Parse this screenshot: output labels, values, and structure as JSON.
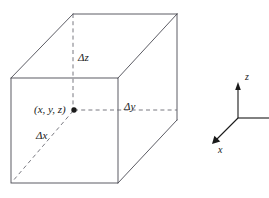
{
  "figure": {
    "top_caption_fragment": "",
    "stroke_color": "#4a4a52",
    "dash_color": "#6a6a72",
    "text_color": "#1a1a1a",
    "background": "#ffffff"
  },
  "box": {
    "name": "differential-volume-element",
    "front_face": {
      "top_left": [
        11,
        78
      ],
      "top_right": [
        118,
        78
      ],
      "bottom_right": [
        118,
        183
      ],
      "bottom_left": [
        11,
        183
      ]
    },
    "back_face": {
      "top_left": [
        73,
        14
      ],
      "top_right": [
        177,
        14
      ],
      "bottom_right": [
        177,
        120
      ],
      "bottom_left": [
        73,
        120
      ]
    }
  },
  "labels": {
    "delta_z": "Δz",
    "delta_y": "Δy",
    "delta_x": "Δx",
    "point": "(x, y, z)"
  },
  "axes": {
    "z_label": "z",
    "x_label": "x",
    "origin": [
      238,
      118
    ],
    "z_tip": [
      238,
      84
    ],
    "x_tip": [
      213,
      143
    ],
    "y_end": [
      269,
      118
    ]
  }
}
